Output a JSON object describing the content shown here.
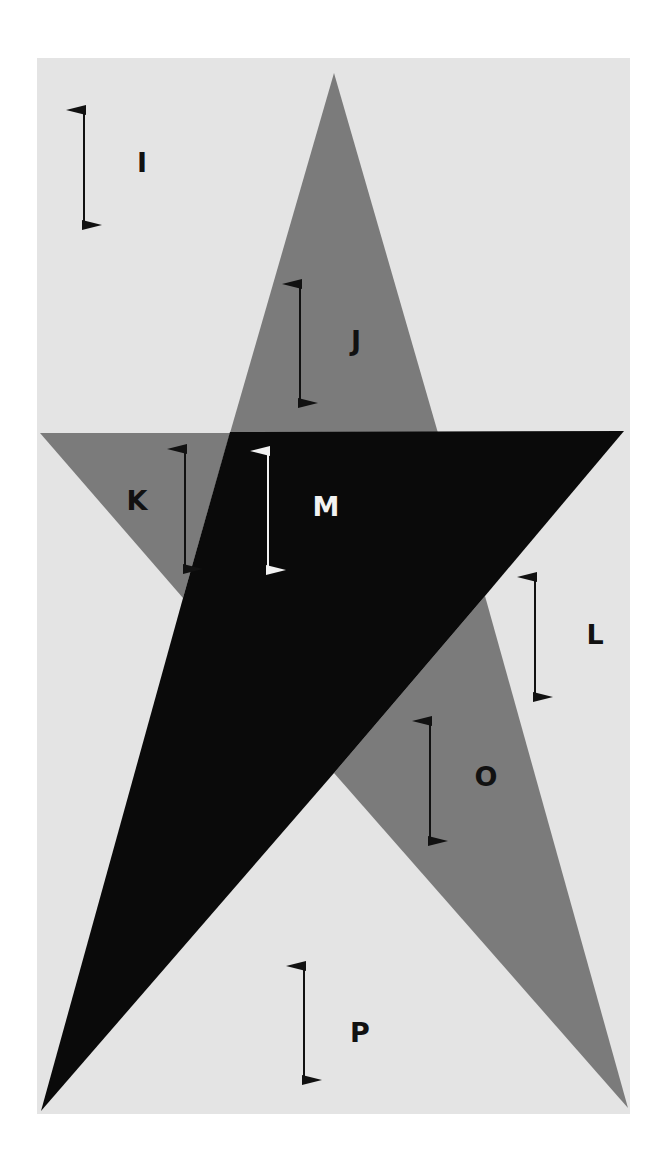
{
  "colors": {
    "page": "#ffffff",
    "panel": "#e4e4e4",
    "gray": "#7b7b7b",
    "black": "#0a0a0a",
    "dark_arrow": "#111111",
    "light_arrow": "#f2f2f2"
  },
  "regions": [
    {
      "id": "I",
      "label": "I",
      "arrow_color": "dark",
      "label_color": "dark"
    },
    {
      "id": "J",
      "label": "J",
      "arrow_color": "dark",
      "label_color": "dark"
    },
    {
      "id": "K",
      "label": "K",
      "arrow_color": "dark",
      "label_color": "dark"
    },
    {
      "id": "L",
      "label": "L",
      "arrow_color": "dark",
      "label_color": "dark"
    },
    {
      "id": "M",
      "label": "M",
      "arrow_color": "light",
      "label_color": "light"
    },
    {
      "id": "O",
      "label": "O",
      "arrow_color": "dark",
      "label_color": "dark"
    },
    {
      "id": "P",
      "label": "P",
      "arrow_color": "dark",
      "label_color": "dark"
    }
  ],
  "labels": {
    "I": "I",
    "J": "J",
    "K": "K",
    "L": "L",
    "M": "M",
    "O": "O",
    "P": "P"
  }
}
